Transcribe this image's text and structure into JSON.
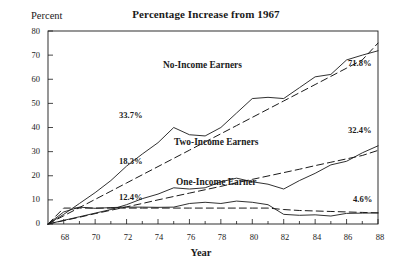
{
  "chart_data": {
    "type": "line",
    "title": "Percentage Increase from 1967",
    "xlabel": "Year",
    "ylabel": "Percent",
    "xlim": [
      67,
      88
    ],
    "ylim": [
      0,
      80
    ],
    "grid": false,
    "legend": "inline-labels",
    "x": [
      67,
      68,
      69,
      70,
      71,
      72,
      73,
      74,
      75,
      76,
      77,
      78,
      79,
      80,
      81,
      82,
      83,
      84,
      85,
      86,
      87,
      88
    ],
    "xticks": [
      "68",
      "70",
      "72",
      "74",
      "76",
      "78",
      "80",
      "82",
      "84",
      "86",
      "88"
    ],
    "xtick_values": [
      68,
      70,
      72,
      74,
      76,
      78,
      80,
      82,
      84,
      86,
      88
    ],
    "yticks": [
      "0",
      "10",
      "20",
      "30",
      "40",
      "50",
      "60",
      "70",
      "80"
    ],
    "ytick_values": [
      0,
      10,
      20,
      30,
      40,
      50,
      60,
      70,
      80
    ],
    "series": [
      {
        "name": "No-Income Earners",
        "style": "solid",
        "end_value": 71.8,
        "values": [
          0.0,
          4.0,
          8.5,
          13.0,
          18.0,
          24.0,
          29.0,
          33.7,
          40.0,
          37.0,
          36.5,
          40.0,
          46.0,
          52.0,
          52.5,
          52.0,
          56.5,
          61.0,
          62.0,
          68.0,
          70.0,
          71.8
        ]
      },
      {
        "name": "No-Income Earners Trend",
        "style": "dashed",
        "values": [
          0.0,
          3.4,
          6.8,
          10.2,
          13.6,
          17.0,
          20.4,
          23.8,
          27.2,
          30.6,
          34.0,
          37.4,
          40.8,
          44.2,
          47.6,
          51.0,
          54.4,
          57.8,
          61.2,
          64.6,
          68.0,
          75.0
        ]
      },
      {
        "name": "Two-Income Earners",
        "style": "solid",
        "end_value": 32.4,
        "values": [
          0.0,
          1.5,
          3.0,
          4.5,
          6.0,
          8.0,
          10.5,
          12.4,
          15.0,
          14.5,
          15.0,
          17.5,
          19.0,
          17.5,
          16.5,
          14.5,
          18.0,
          21.0,
          24.5,
          26.0,
          29.5,
          32.4
        ]
      },
      {
        "name": "Two-Income Earners Trend",
        "style": "dashed",
        "values": [
          0.0,
          1.4,
          2.8,
          4.3,
          5.7,
          7.1,
          8.5,
          10.0,
          11.4,
          12.8,
          14.2,
          15.6,
          17.1,
          18.5,
          19.9,
          21.3,
          22.7,
          24.2,
          25.6,
          27.0,
          28.4,
          30.5
        ]
      },
      {
        "name": "One-Income Earner",
        "style": "solid",
        "end_value": 4.6,
        "values": [
          0.0,
          5.0,
          7.0,
          6.5,
          6.8,
          7.0,
          7.0,
          6.9,
          7.0,
          8.5,
          9.0,
          8.5,
          9.5,
          9.0,
          8.0,
          4.0,
          3.6,
          3.8,
          3.3,
          4.4,
          4.5,
          4.6
        ]
      },
      {
        "name": "One-Income Earner Trend",
        "style": "dashed",
        "values": [
          0.0,
          6.6,
          6.6,
          6.6,
          6.6,
          6.6,
          6.6,
          6.6,
          6.6,
          6.6,
          6.6,
          6.6,
          6.6,
          6.6,
          6.6,
          6.0,
          5.6,
          5.4,
          5.2,
          5.0,
          4.8,
          4.6
        ]
      }
    ],
    "annotations": [
      {
        "text": "33.7%",
        "x": 74,
        "y": 33.7,
        "place": "left-of-point"
      },
      {
        "text": "18.3%",
        "x": 74,
        "y": 18.3,
        "place": "left-of-point"
      },
      {
        "text": "12.4%",
        "x": 74,
        "y": 12.4,
        "place": "left-of-point"
      },
      {
        "text": "71.8%",
        "x": 88,
        "y": 71.8,
        "place": "inside-right"
      },
      {
        "text": "32.4%",
        "x": 88,
        "y": 32.4,
        "place": "inside-right"
      },
      {
        "text": "4.6%",
        "x": 88,
        "y": 4.6,
        "place": "inside-right"
      }
    ],
    "series_labels": [
      {
        "text": "No-Income Earners",
        "x": 76.5,
        "y": 62
      },
      {
        "text": "Two-Income Earners",
        "x": 77.5,
        "y": 29.5
      },
      {
        "text": "One-Income Earner",
        "x": 77.5,
        "y": 12.5
      }
    ],
    "colors": {
      "line": "#1a1a1a",
      "axis": "#1a1a1a",
      "background": "#ffffff"
    }
  },
  "labels": {
    "title": "Percentage Increase from 1967",
    "y_axis_title": "Percent",
    "x_axis_title": "Year",
    "ann_337": "33.7%",
    "ann_183": "18.3%",
    "ann_124": "12.4%",
    "ann_718": "71.8%",
    "ann_324": "32.4%",
    "ann_46": "4.6%",
    "series_no_income": "No-Income Earners",
    "series_two_income": "Two-Income Earners",
    "series_one_income": "One-Income Earner",
    "y0": "0",
    "y10": "10",
    "y20": "20",
    "y30": "30",
    "y40": "40",
    "y50": "50",
    "y60": "60",
    "y70": "70",
    "y80": "80",
    "x68": "68",
    "x70": "70",
    "x72": "72",
    "x74": "74",
    "x76": "76",
    "x78": "78",
    "x80": "80",
    "x82": "82",
    "x84": "84",
    "x86": "86",
    "x88": "88"
  }
}
